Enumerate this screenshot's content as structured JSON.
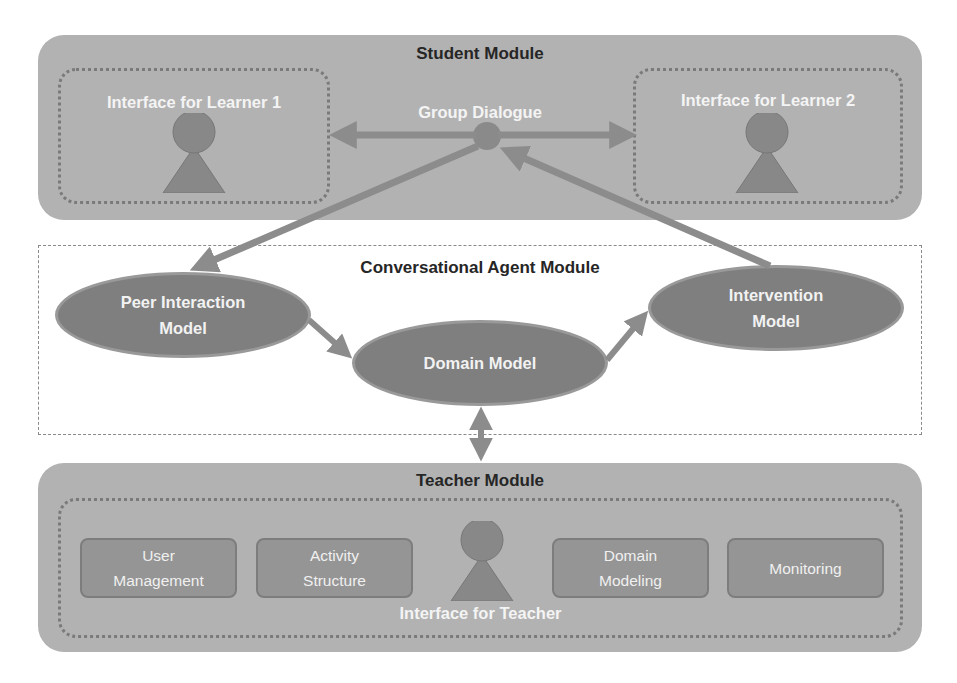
{
  "student_module": {
    "title": "Student Module",
    "learner1": {
      "label": "Interface for Learner 1",
      "icon": "person-icon"
    },
    "learner2": {
      "label": "Interface for Learner 2",
      "icon": "person-icon"
    },
    "group_dialogue": {
      "label": "Group Dialogue"
    }
  },
  "agent_module": {
    "title": "Conversational Agent Module",
    "peer_model": {
      "line1": "Peer Interaction",
      "line2": "Model"
    },
    "domain_model": {
      "label": "Domain Model"
    },
    "intervention_model": {
      "line1": "Intervention",
      "line2": "Model"
    }
  },
  "teacher_module": {
    "title": "Teacher Module",
    "interface_label": "Interface for Teacher",
    "icon": "person-icon",
    "tools": [
      {
        "line1": "User",
        "line2": "Management"
      },
      {
        "line1": "Activity",
        "line2": "Structure"
      },
      {
        "line1": "Domain",
        "line2": "Modeling"
      },
      {
        "line1": "Monitoring",
        "line2": ""
      }
    ]
  },
  "colors": {
    "module_fill": "#b2b2b2",
    "node_fill": "#7f7f7f",
    "arrow": "#8c8c8c",
    "title_text": "#262626",
    "node_text": "#f2f2f2"
  }
}
